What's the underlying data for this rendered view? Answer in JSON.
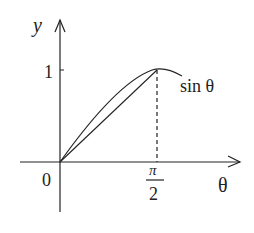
{
  "diagram": {
    "labels": {
      "y_axis": "y",
      "x_axis": "θ",
      "origin": "0",
      "y_tick": "1",
      "x_tick_num": "π",
      "x_tick_den": "2",
      "curve": "sin θ"
    },
    "colors": {
      "stroke": "#222222",
      "background": "#ffffff"
    }
  }
}
